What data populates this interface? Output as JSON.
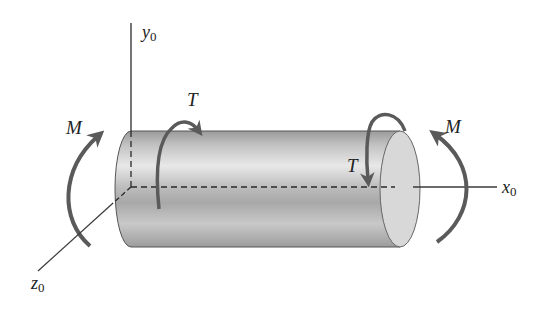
{
  "diagram": {
    "axes": {
      "y": {
        "symbol": "y",
        "subscript": "0"
      },
      "x": {
        "symbol": "x",
        "subscript": "0"
      },
      "z": {
        "symbol": "z",
        "subscript": "0"
      }
    },
    "loads": {
      "moment_left": {
        "symbol": "M"
      },
      "moment_right": {
        "symbol": "M"
      },
      "torque_left": {
        "symbol": "T"
      },
      "torque_right": {
        "symbol": "T"
      }
    },
    "colors": {
      "arrow": "#5a5a5a",
      "axis": "#3a3a3a",
      "cylinder_light": "#e6e6e6",
      "cylinder_mid": "#b4b4b4",
      "cylinder_dark": "#8e8e8e",
      "end_cap": "#d8d8d8"
    }
  }
}
